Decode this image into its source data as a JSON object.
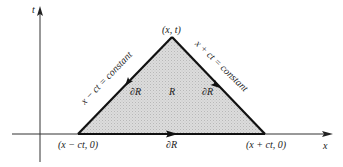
{
  "figure": {
    "axes": {
      "vertical_label": "t",
      "horizontal_label": "x"
    },
    "apex_label": "(x, t)",
    "left_base_label": "(x − ct, 0)",
    "right_base_label": "(x + ct, 0)",
    "left_char_label": "x − ct = constant",
    "right_char_label": "x + ct = constant",
    "region_label": "R",
    "boundary_label_left": "∂R",
    "boundary_label_right": "∂R",
    "boundary_label_bottom": "∂R",
    "colors": {
      "fill": "#d4d4d4",
      "edge": "#111111",
      "axis": "#333333"
    }
  }
}
